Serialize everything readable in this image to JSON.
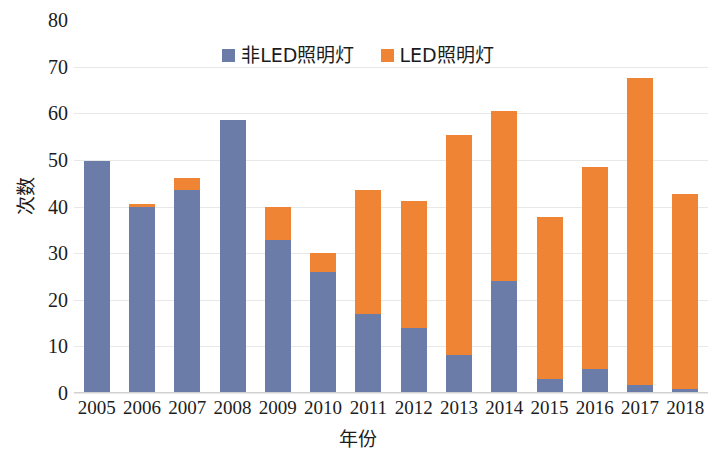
{
  "chart_data": {
    "type": "bar",
    "subtype": "stacked-bar",
    "title": "",
    "xlabel": "年份",
    "ylabel": "次数",
    "categories": [
      "2005",
      "2006",
      "2007",
      "2008",
      "2009",
      "2010",
      "2011",
      "2012",
      "2013",
      "2014",
      "2015",
      "2016",
      "2017",
      "2018"
    ],
    "series": [
      {
        "name": "非LED照明灯",
        "color": "#6b7ca8",
        "values": [
          49.8,
          39.8,
          43.6,
          58.5,
          32.9,
          26.0,
          16.9,
          13.9,
          8.2,
          24.0,
          3.1,
          5.2,
          1.8,
          0.9
        ]
      },
      {
        "name": "LED照明灯",
        "color": "#ee8434",
        "values": [
          0.0,
          0.8,
          2.6,
          0.0,
          6.9,
          4.0,
          26.7,
          27.3,
          47.2,
          36.5,
          34.7,
          43.3,
          65.7,
          41.8
        ]
      }
    ],
    "totals": [
      49.8,
      40.6,
      46.2,
      58.5,
      39.8,
      30.0,
      43.6,
      41.2,
      55.4,
      60.5,
      37.8,
      48.5,
      67.5,
      42.7
    ],
    "ylim": [
      0,
      80
    ],
    "ytick_step": 10,
    "yticks": [
      "80",
      "70",
      "60",
      "50",
      "40",
      "30",
      "20",
      "10",
      "0"
    ],
    "grid": true,
    "grid_axis": "y",
    "legend_position": "top-center",
    "legend": [
      {
        "label": "非LED照明灯",
        "color": "#6b7ca8"
      },
      {
        "label": "LED照明灯",
        "color": "#ee8434"
      }
    ]
  }
}
